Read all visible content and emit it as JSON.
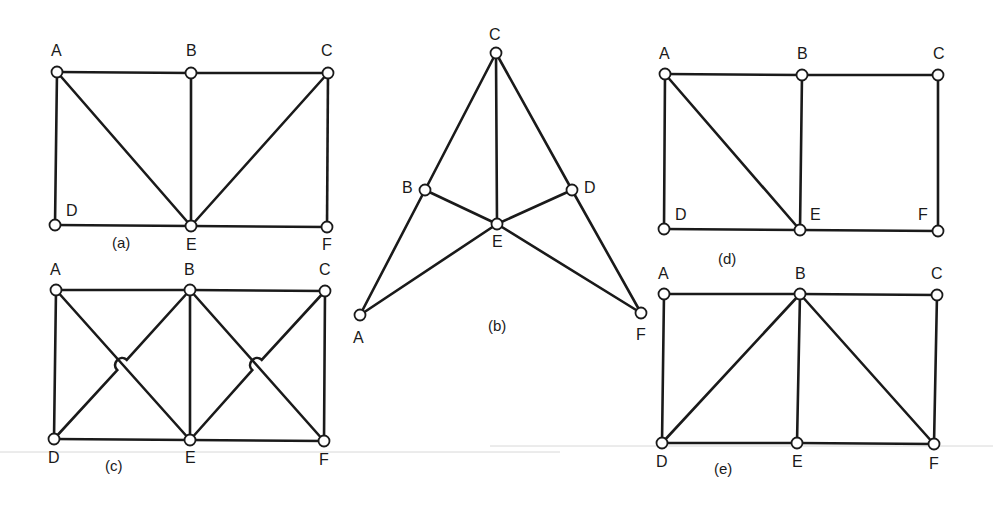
{
  "figure": {
    "diagrams": [
      {
        "id": "a",
        "caption": "(a)",
        "caption_pos": [
          112,
          248
        ],
        "nodes": [
          {
            "id": "A",
            "x": 57,
            "y": 72,
            "label": "A",
            "lx": 51,
            "ly": 56
          },
          {
            "id": "B",
            "x": 191,
            "y": 73,
            "label": "B",
            "lx": 186,
            "ly": 56
          },
          {
            "id": "C",
            "x": 328,
            "y": 73,
            "label": "C",
            "lx": 321,
            "ly": 56
          },
          {
            "id": "D",
            "x": 55,
            "y": 225,
            "label": "D",
            "lx": 66,
            "ly": 216
          },
          {
            "id": "E",
            "x": 191,
            "y": 226,
            "label": "E",
            "lx": 186,
            "ly": 250
          },
          {
            "id": "F",
            "x": 327,
            "y": 227,
            "label": "F",
            "lx": 322,
            "ly": 250
          }
        ],
        "edges": [
          [
            "A",
            "B"
          ],
          [
            "B",
            "C"
          ],
          [
            "A",
            "D"
          ],
          [
            "A",
            "E"
          ],
          [
            "B",
            "E"
          ],
          [
            "C",
            "E"
          ],
          [
            "C",
            "F"
          ],
          [
            "D",
            "E"
          ],
          [
            "E",
            "F"
          ]
        ],
        "hops": []
      },
      {
        "id": "b",
        "caption": "(b)",
        "caption_pos": [
          488,
          331
        ],
        "nodes": [
          {
            "id": "C",
            "x": 496,
            "y": 53,
            "label": "C",
            "lx": 489,
            "ly": 40
          },
          {
            "id": "B",
            "x": 425,
            "y": 190,
            "label": "B",
            "lx": 402,
            "ly": 193
          },
          {
            "id": "D",
            "x": 572,
            "y": 190,
            "label": "D",
            "lx": 584,
            "ly": 193
          },
          {
            "id": "E",
            "x": 497,
            "y": 224,
            "label": "E",
            "lx": 492,
            "ly": 247
          },
          {
            "id": "A",
            "x": 360,
            "y": 315,
            "label": "A",
            "lx": 353,
            "ly": 343
          },
          {
            "id": "F",
            "x": 641,
            "y": 313,
            "label": "F",
            "lx": 636,
            "ly": 340
          }
        ],
        "edges": [
          [
            "C",
            "B"
          ],
          [
            "C",
            "E"
          ],
          [
            "C",
            "D"
          ],
          [
            "B",
            "A"
          ],
          [
            "B",
            "E"
          ],
          [
            "D",
            "E"
          ],
          [
            "D",
            "F"
          ],
          [
            "A",
            "E"
          ],
          [
            "E",
            "F"
          ]
        ],
        "hops": []
      },
      {
        "id": "c",
        "caption": "(c)",
        "caption_pos": [
          105,
          471
        ],
        "nodes": [
          {
            "id": "A",
            "x": 56,
            "y": 290,
            "label": "A",
            "lx": 50,
            "ly": 275
          },
          {
            "id": "B",
            "x": 190,
            "y": 290,
            "label": "B",
            "lx": 184,
            "ly": 275
          },
          {
            "id": "C",
            "x": 325,
            "y": 291,
            "label": "C",
            "lx": 319,
            "ly": 275
          },
          {
            "id": "D",
            "x": 54,
            "y": 439,
            "label": "D",
            "lx": 48,
            "ly": 463
          },
          {
            "id": "E",
            "x": 190,
            "y": 440,
            "label": "E",
            "lx": 185,
            "ly": 463
          },
          {
            "id": "F",
            "x": 324,
            "y": 441,
            "label": "F",
            "lx": 319,
            "ly": 465
          }
        ],
        "edges": [
          [
            "A",
            "B"
          ],
          [
            "B",
            "C"
          ],
          [
            "A",
            "D"
          ],
          [
            "B",
            "E"
          ],
          [
            "C",
            "F"
          ],
          [
            "D",
            "E"
          ],
          [
            "E",
            "F"
          ],
          [
            "A",
            "E"
          ],
          [
            "B",
            "F"
          ]
        ],
        "hops": [
          {
            "from": "D",
            "to": "B",
            "cx": 122,
            "cy": 365
          },
          {
            "from": "E",
            "to": "C",
            "cx": 257,
            "cy": 365
          }
        ]
      },
      {
        "id": "d",
        "caption": "(d)",
        "caption_pos": [
          718,
          264
        ],
        "nodes": [
          {
            "id": "A",
            "x": 665,
            "y": 74,
            "label": "A",
            "lx": 659,
            "ly": 59
          },
          {
            "id": "B",
            "x": 802,
            "y": 75,
            "label": "B",
            "lx": 797,
            "ly": 59
          },
          {
            "id": "C",
            "x": 938,
            "y": 75,
            "label": "C",
            "lx": 933,
            "ly": 59
          },
          {
            "id": "D",
            "x": 664,
            "y": 229,
            "label": "D",
            "lx": 675,
            "ly": 220
          },
          {
            "id": "E",
            "x": 800,
            "y": 230,
            "label": "E",
            "lx": 810,
            "ly": 220
          },
          {
            "id": "F",
            "x": 938,
            "y": 231,
            "label": "F",
            "lx": 918,
            "ly": 220
          }
        ],
        "edges": [
          [
            "A",
            "B"
          ],
          [
            "B",
            "C"
          ],
          [
            "A",
            "D"
          ],
          [
            "A",
            "E"
          ],
          [
            "B",
            "E"
          ],
          [
            "C",
            "F"
          ],
          [
            "D",
            "E"
          ],
          [
            "E",
            "F"
          ]
        ],
        "hops": []
      },
      {
        "id": "e",
        "caption": "(e)",
        "caption_pos": [
          714,
          474
        ],
        "nodes": [
          {
            "id": "A",
            "x": 664,
            "y": 294,
            "label": "A",
            "lx": 658,
            "ly": 279
          },
          {
            "id": "B",
            "x": 800,
            "y": 294,
            "label": "B",
            "lx": 795,
            "ly": 279
          },
          {
            "id": "C",
            "x": 937,
            "y": 295,
            "label": "C",
            "lx": 931,
            "ly": 279
          },
          {
            "id": "D",
            "x": 662,
            "y": 443,
            "label": "D",
            "lx": 656,
            "ly": 467
          },
          {
            "id": "E",
            "x": 797,
            "y": 443,
            "label": "E",
            "lx": 792,
            "ly": 467
          },
          {
            "id": "F",
            "x": 934,
            "y": 444,
            "label": "F",
            "lx": 929,
            "ly": 469
          }
        ],
        "edges": [
          [
            "A",
            "B"
          ],
          [
            "B",
            "C"
          ],
          [
            "A",
            "D"
          ],
          [
            "B",
            "D"
          ],
          [
            "B",
            "E"
          ],
          [
            "B",
            "F"
          ],
          [
            "C",
            "F"
          ],
          [
            "D",
            "E"
          ],
          [
            "E",
            "F"
          ]
        ],
        "hops": []
      }
    ],
    "colors": {
      "line": "#1a1a1a",
      "node_fill": "#ffffff",
      "background": "#ffffff"
    }
  }
}
